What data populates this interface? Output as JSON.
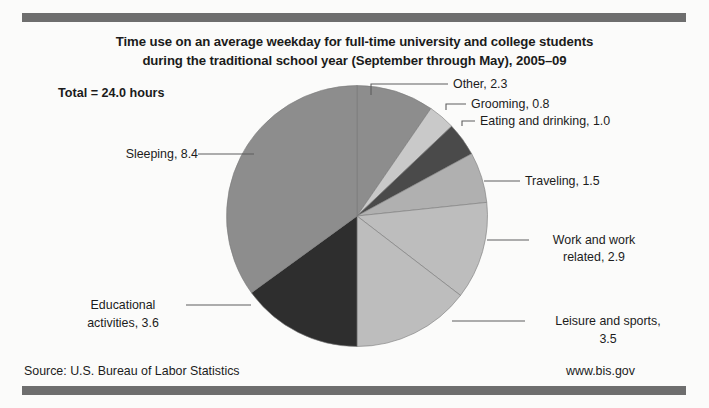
{
  "figure": {
    "title_line1": "Time use on an average weekday for full-time university and college students",
    "title_line2": "during the traditional school year (September through May), 2005–09",
    "total_note": "Total = 24.0 hours",
    "source": "Source: U.S. Bureau of Labor Statistics",
    "website": "www.bis.gov"
  },
  "labels": {
    "other": "Other, 2.3",
    "grooming": "Grooming, 0.8",
    "eating": "Eating and drinking, 1.0",
    "traveling": "Traveling, 1.5",
    "work_l1": "Work and work",
    "work_l2": "related, 2.9",
    "leisure_l1": "Leisure and sports,",
    "leisure_l2": "3.5",
    "education_l1": "Educational",
    "education_l2": "activities, 3.6",
    "sleeping": "Sleeping, 8.4"
  },
  "chart_data": {
    "type": "pie",
    "title": "Time use on an average weekday for full-time university and college students during the traditional school year (September through May), 2005–09",
    "unit": "hours",
    "total": 24.0,
    "legend_position": "callout-labels",
    "grid": false,
    "categories": [
      "Other",
      "Grooming",
      "Eating and drinking",
      "Traveling",
      "Work and work related",
      "Leisure and sports",
      "Educational activities",
      "Sleeping"
    ],
    "values": [
      2.3,
      0.8,
      1.0,
      1.5,
      2.9,
      3.5,
      3.6,
      8.4
    ],
    "colors": [
      "#8d8d8d",
      "#c9c9c9",
      "#4a4a4a",
      "#b0b0b0",
      "#bdbdbd",
      "#bdbdbd",
      "#2e2e2e",
      "#8d8d8d"
    ],
    "start_angle_deg": 0,
    "direction": "clockwise"
  },
  "style": {
    "rule_color": "#6e6e6e",
    "text_color": "#1c1c1c",
    "background": "#fbfbfa",
    "leader_color": "#5e5e5e"
  }
}
